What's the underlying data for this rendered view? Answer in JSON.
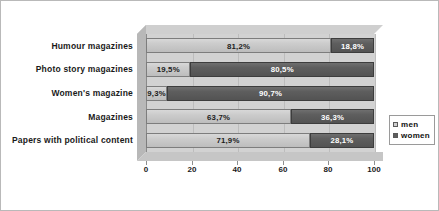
{
  "chart_data": {
    "type": "bar",
    "orientation": "horizontal",
    "stacked": true,
    "stacked_percent": true,
    "title": "",
    "subtitle": "",
    "xlabel": "",
    "ylabel": "",
    "xlim": [
      0,
      100
    ],
    "xticks": [
      0,
      20,
      40,
      60,
      80,
      100
    ],
    "xticklabels": [
      "0",
      "20",
      "40",
      "60",
      "80",
      "100"
    ],
    "grid": true,
    "legend_position": "right",
    "categories": [
      "Humour magazines",
      "Photo story magazines",
      "Women's magazine",
      "Magazines",
      "Papers with political content"
    ],
    "series": [
      {
        "name": "men",
        "color": "#cfcfcf",
        "values": [
          81.2,
          19.5,
          9.3,
          63.7,
          71.9
        ],
        "labels": [
          "81,2%",
          "19,5%",
          "9,3%",
          "63,7%",
          "71,9%"
        ]
      },
      {
        "name": "women",
        "color": "#5e5e5e",
        "values": [
          18.8,
          80.5,
          90.7,
          36.3,
          28.1
        ],
        "labels": [
          "18,8%",
          "80,5%",
          "90,7%",
          "36,3%",
          "28,1%"
        ]
      }
    ]
  },
  "legend": {
    "items": [
      {
        "label": "men"
      },
      {
        "label": "women"
      }
    ]
  },
  "colors": {
    "men": "#cfcfcf",
    "women": "#5e5e5e",
    "plot_background": "#d2d2d2",
    "page_background": "#ffffff",
    "border": "#b9b9b9"
  }
}
